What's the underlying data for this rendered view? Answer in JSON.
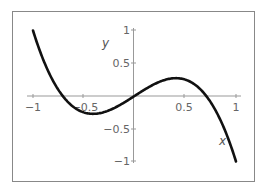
{
  "chart_data": {
    "type": "line",
    "title": "",
    "xlabel": "x",
    "ylabel": "y",
    "xlim": [
      -1,
      1
    ],
    "ylim": [
      -1,
      1
    ],
    "x_ticks": [
      "-1",
      "-0.5",
      "0.5",
      "1"
    ],
    "y_ticks": [
      "1",
      "0.5",
      "-0.5",
      "-1"
    ],
    "grid": false,
    "legend": null,
    "series": [
      {
        "name": "y = x - 2x^3",
        "x": [
          -1,
          -0.75,
          -0.5,
          -0.408,
          -0.25,
          0,
          0.25,
          0.408,
          0.5,
          0.75,
          1
        ],
        "y": [
          1,
          0.094,
          -0.25,
          -0.272,
          -0.219,
          0,
          0.219,
          0.272,
          0.25,
          -0.094,
          -1
        ]
      }
    ]
  },
  "labels": {
    "x_axis": "x",
    "y_axis": "y",
    "xt_m1": "−1",
    "xt_m05": "−0.5",
    "xt_05": "0.5",
    "xt_1": "1",
    "yt_1": "1",
    "yt_05": "0.5",
    "yt_m05": "−0.5",
    "yt_m1": "−1"
  },
  "colors": {
    "curve": "#111111",
    "axis": "#999999",
    "frame": "#888888"
  }
}
